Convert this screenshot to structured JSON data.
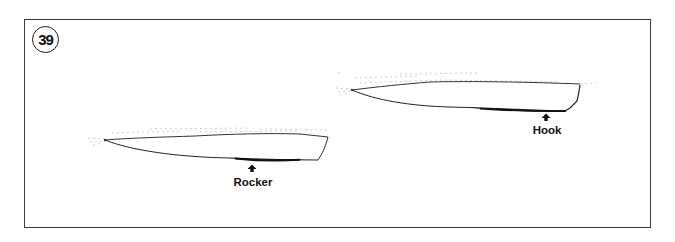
{
  "figure": {
    "number": "39",
    "frame_color": "#3a3a3a",
    "ink_color": "#111111"
  },
  "hulls": [
    {
      "id": "rocker-hull",
      "label": "Rocker",
      "description": "Hull profile with rocker (curved bottom) marked by arrow",
      "arrow_icon": "arrow-up-icon"
    },
    {
      "id": "hook-hull",
      "label": "Hook",
      "description": "Hull profile with hook (concave aft bottom) marked by arrow",
      "arrow_icon": "arrow-up-icon"
    }
  ]
}
